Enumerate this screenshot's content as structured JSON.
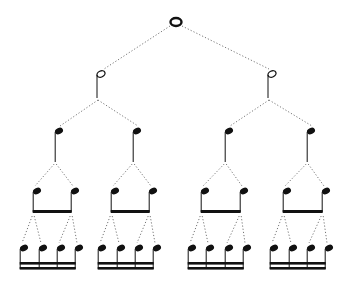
{
  "diagram": {
    "title": "",
    "colors": {
      "note": "#111111",
      "connector": "#777777",
      "background": "#ffffff"
    },
    "levels": [
      {
        "name": "whole",
        "count": 1,
        "y": 22
      },
      {
        "name": "half",
        "count": 2,
        "y": 74
      },
      {
        "name": "quarter",
        "count": 4,
        "y": 131
      },
      {
        "name": "eighth",
        "count": 8,
        "y": 191,
        "beam_groups": 4,
        "beams": 1
      },
      {
        "name": "sixteenth",
        "count": 16,
        "y": 248,
        "beam_groups": 4,
        "beams": 2
      }
    ]
  }
}
